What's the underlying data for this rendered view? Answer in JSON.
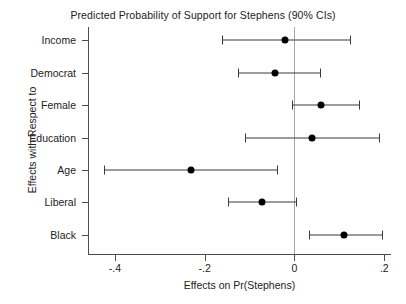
{
  "chart_data": {
    "type": "scatter",
    "title": "Predicted Probability of Support for Stephens (90% CIs)",
    "subtitle": "",
    "xlabel": "Effects on Pr(Stephens)",
    "ylabel": "Effects with Respect to",
    "xlim": [
      -0.46,
      0.215
    ],
    "xticks": [
      -0.4,
      -0.2,
      0,
      0.2
    ],
    "xticklabels": [
      "-.4",
      "-.2",
      "0",
      ".2"
    ],
    "categories": [
      "Income",
      "Democrat",
      "Female",
      "Education",
      "Age",
      "Liberal",
      "Black"
    ],
    "grid": false,
    "legend": "none",
    "reference_line": 0,
    "confidence_level": "90%",
    "series": [
      {
        "name": "Estimated effect on Pr(Stephens)",
        "values": [
          -0.022,
          -0.043,
          0.058,
          0.039,
          -0.231,
          -0.073,
          0.11
        ],
        "ci_lower": [
          -0.162,
          -0.126,
          -0.006,
          -0.11,
          -0.424,
          -0.149,
          0.032
        ],
        "ci_upper": [
          0.123,
          0.057,
          0.143,
          0.188,
          -0.04,
          0.004,
          0.194
        ]
      }
    ],
    "points": [
      {
        "category": "Income",
        "estimate": -0.022,
        "ci_lower": -0.162,
        "ci_upper": 0.123
      },
      {
        "category": "Democrat",
        "estimate": -0.043,
        "ci_lower": -0.126,
        "ci_upper": 0.057
      },
      {
        "category": "Female",
        "estimate": 0.058,
        "ci_lower": -0.006,
        "ci_upper": 0.143
      },
      {
        "category": "Education",
        "estimate": 0.039,
        "ci_lower": -0.11,
        "ci_upper": 0.188
      },
      {
        "category": "Age",
        "estimate": -0.231,
        "ci_lower": -0.424,
        "ci_upper": -0.04
      },
      {
        "category": "Liberal",
        "estimate": -0.073,
        "ci_lower": -0.149,
        "ci_upper": 0.004
      },
      {
        "category": "Black",
        "estimate": 0.11,
        "ci_lower": 0.032,
        "ci_upper": 0.194
      }
    ],
    "colors": {
      "marker": "#000000",
      "ci": "#3a3a3a",
      "axis": "#4d4d4d",
      "reference": "#a8a8a8",
      "background": "#ffffff",
      "text": "#222222"
    }
  }
}
